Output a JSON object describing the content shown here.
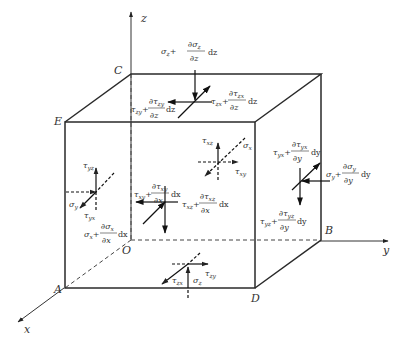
{
  "diagram": {
    "axes": {
      "x": "x",
      "y": "y",
      "z": "z"
    },
    "vertices": {
      "A": "A",
      "B": "B",
      "C": "C",
      "D": "D",
      "E": "E",
      "O": "O"
    },
    "labels": {
      "top_sigma_z": {
        "base": "σ",
        "sub": "z",
        "plus": "+",
        "num": "∂σ",
        "num_sub": "z",
        "den": "∂z",
        "d": "dz"
      },
      "top_tau_zy": {
        "base": "τ",
        "sub": "zy",
        "plus": "+",
        "num": "∂τ",
        "num_sub": "zy",
        "den": "∂z",
        "d": "dz"
      },
      "top_tau_zx": {
        "base": "τ",
        "sub": "zx",
        "plus": "+",
        "num": "∂τ",
        "num_sub": "zx",
        "den": "∂z",
        "d": "dz"
      },
      "back_tau_xz": {
        "base": "τ",
        "sub": "xz"
      },
      "back_sigma_x": {
        "base": "σ",
        "sub": "x"
      },
      "back_tau_xy": {
        "base": "τ",
        "sub": "xy"
      },
      "front_tau_xy": {
        "base": "τ",
        "sub": "xy",
        "plus": "+",
        "num": "∂τ",
        "num_sub": "xy",
        "den": "∂x",
        "d": "dx"
      },
      "front_tau_xz": {
        "base": "τ",
        "sub": "xz",
        "plus": "+",
        "num": "∂τ",
        "num_sub": "xz",
        "den": "∂x",
        "d": "dx"
      },
      "front_sigma_x": {
        "base": "σ",
        "sub": "x",
        "plus": "+",
        "num": "∂σ",
        "num_sub": "x",
        "den": "∂x",
        "d": "dx"
      },
      "left_tau_yz": {
        "base": "τ",
        "sub": "yz"
      },
      "left_sigma_y": {
        "base": "σ",
        "sub": "y"
      },
      "left_tau_yx": {
        "base": "τ",
        "sub": "yx"
      },
      "right_tau_yx": {
        "base": "τ",
        "sub": "yx",
        "plus": "+",
        "num": "∂τ",
        "num_sub": "yx",
        "den": "∂y",
        "d": "dy"
      },
      "right_sigma_y": {
        "base": "σ",
        "sub": "y",
        "plus": "+",
        "num": "∂σ",
        "num_sub": "y",
        "den": "∂y",
        "d": "dy"
      },
      "right_tau_yz": {
        "base": "τ",
        "sub": "yz",
        "plus": "+",
        "num": "∂τ",
        "num_sub": "yz",
        "den": "∂y",
        "d": "dy"
      },
      "bottom_tau_zy": {
        "base": "τ",
        "sub": "zy"
      },
      "bottom_tau_zx": {
        "base": "τ",
        "sub": "zx"
      },
      "bottom_sigma_z": {
        "base": "σ",
        "sub": "z"
      }
    }
  }
}
